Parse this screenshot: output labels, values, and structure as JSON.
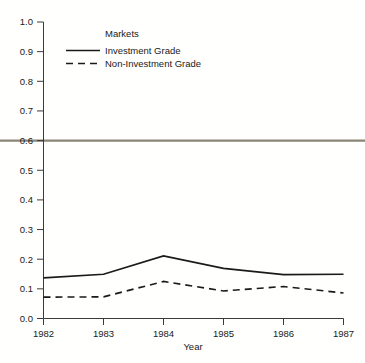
{
  "chart_data": {
    "type": "line",
    "title": "",
    "xlabel": "Year",
    "ylabel": "",
    "x": [
      1982,
      1983,
      1984,
      1985,
      1986,
      1987
    ],
    "categories": [
      "1982",
      "1983",
      "1984",
      "1985",
      "1986",
      "1987"
    ],
    "series": [
      {
        "name": "Investment Grade",
        "style": "solid",
        "color": "#1a1a1a",
        "values": [
          0.137,
          0.149,
          0.211,
          0.169,
          0.148,
          0.149
        ]
      },
      {
        "name": "Non-Investment Grade",
        "style": "dashed",
        "color": "#1a1a1a",
        "values": [
          0.072,
          0.073,
          0.125,
          0.093,
          0.108,
          0.086
        ]
      }
    ],
    "xlim": [
      1982,
      1987
    ],
    "ylim": [
      0.0,
      1.0
    ],
    "ytick_labels": [
      "0.0",
      "0.1",
      "0.2",
      "0.3",
      "0.4",
      "0.5",
      "0.6",
      "0.7",
      "0.8",
      "0.9",
      "1.0"
    ],
    "ytick_values": [
      0.0,
      0.1,
      0.2,
      0.3,
      0.4,
      0.5,
      0.6,
      0.7,
      0.8,
      0.9,
      1.0
    ],
    "xtick_labels": [
      "1982",
      "1983",
      "1984",
      "1985",
      "1986",
      "1987"
    ],
    "grid": false,
    "legend_position": "top-center",
    "annotations": [
      {
        "name": "reference-line",
        "type": "horizontal-line",
        "value": 0.6,
        "color": "#8a8577",
        "spans_full_width": true
      }
    ]
  },
  "legend": {
    "title": "Markets",
    "entries": [
      {
        "label": "Investment Grade",
        "style": "solid"
      },
      {
        "label": "Non-Investment Grade",
        "style": "dashed"
      }
    ]
  },
  "axes": {
    "x_title": "Year",
    "y_ticks": [
      "1.0",
      "0.9",
      "0.8",
      "0.7",
      "0.6",
      "0.5",
      "0.4",
      "0.3",
      "0.2",
      "0.1",
      "0.0"
    ],
    "x_ticks": [
      "1982",
      "1983",
      "1984",
      "1985",
      "1986",
      "1987"
    ]
  },
  "colors": {
    "background": "#fffffd",
    "axis": "#3a3a3a",
    "series": "#1a1a1a",
    "reference": "#8a8577"
  }
}
